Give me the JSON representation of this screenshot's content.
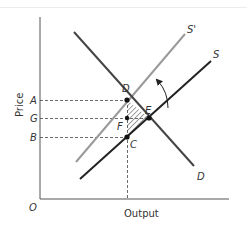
{
  "diagram": {
    "type": "supply-demand",
    "axes": {
      "y_label": "Price",
      "x_label": "Output",
      "origin": "O"
    },
    "price_levels": [
      {
        "label": "A",
        "description": "price at D"
      },
      {
        "label": "G",
        "description": "price at E"
      },
      {
        "label": "B",
        "description": "price at C"
      }
    ],
    "curves": [
      {
        "label": "S'",
        "description": "shifted supply (gray)",
        "color": "#9a9a9a"
      },
      {
        "label": "S",
        "description": "original supply",
        "color": "#222222"
      },
      {
        "label": "D",
        "description": "demand",
        "color": "#444444"
      }
    ],
    "points": [
      "D",
      "E",
      "F",
      "C"
    ],
    "annotations": {
      "shift_arrow": "supply shifts from S to S'",
      "hatched_region": "triangle DEC"
    }
  }
}
